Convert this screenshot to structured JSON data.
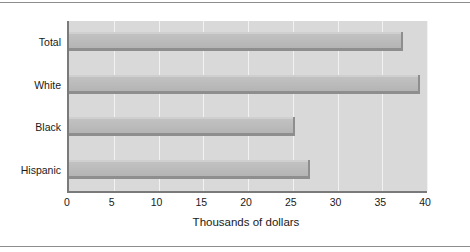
{
  "chart_data": {
    "type": "bar",
    "orientation": "horizontal",
    "title": "",
    "subtitle": "",
    "xlabel": "Thousands of dollars",
    "ylabel": "",
    "categories": [
      "Total",
      "White",
      "Black",
      "Hispanic"
    ],
    "values": [
      37.3,
      39.2,
      25.3,
      26.9
    ],
    "xlim": [
      0,
      40
    ],
    "xticks": [
      0,
      5,
      10,
      15,
      20,
      25,
      30,
      35,
      40
    ],
    "xtick_labels": [
      "0",
      "5",
      "10",
      "15",
      "20",
      "25",
      "30",
      "35",
      "40"
    ],
    "grid": "vertical-only",
    "legend": "none",
    "annotations": []
  },
  "style": {
    "plot_background": "#d9d9d9",
    "gridline_color": "#f2f2f2",
    "bar_fill": "#bdbdbd",
    "bar_shadow": "#8e8e8e",
    "axis_color": "#7a7a7a",
    "rule_color": "#8d8d8d",
    "text_color": "#1a1a1a",
    "figure_background": "#ffffff"
  }
}
